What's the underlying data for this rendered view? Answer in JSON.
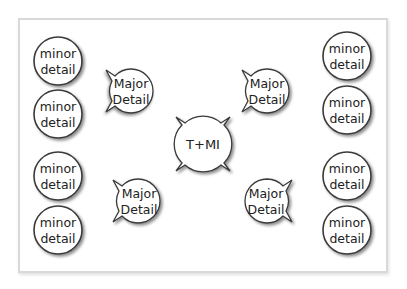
{
  "diagram": {
    "type": "concept-map",
    "center": {
      "label": "T+MI",
      "x": 203,
      "y": 144,
      "r": 27
    },
    "major_details": [
      {
        "id": "major-top-left",
        "line1": "Major",
        "line2": "Detail",
        "x": 131,
        "y": 91,
        "r": 22,
        "tail": "right"
      },
      {
        "id": "major-top-right",
        "line1": "Major",
        "line2": "Detail",
        "x": 267,
        "y": 91,
        "r": 22,
        "tail": "left"
      },
      {
        "id": "major-bottom-left",
        "line1": "Major",
        "line2": "Detail",
        "x": 138,
        "y": 201,
        "r": 22,
        "tail": "right"
      },
      {
        "id": "major-bottom-right",
        "line1": "Major",
        "line2": "Detail",
        "x": 267,
        "y": 201,
        "r": 22,
        "tail": "left"
      }
    ],
    "minor_details": [
      {
        "line1": "minor",
        "line2": "detail",
        "x": 58,
        "y": 61
      },
      {
        "line1": "minor",
        "line2": "detail",
        "x": 58,
        "y": 114
      },
      {
        "line1": "minor",
        "line2": "detail",
        "x": 58,
        "y": 176
      },
      {
        "line1": "minor",
        "line2": "detail",
        "x": 58,
        "y": 230
      },
      {
        "line1": "minor",
        "line2": "detail",
        "x": 347,
        "y": 56
      },
      {
        "line1": "minor",
        "line2": "detail",
        "x": 347,
        "y": 110
      },
      {
        "line1": "minor",
        "line2": "detail",
        "x": 347,
        "y": 176
      },
      {
        "line1": "minor",
        "line2": "detail",
        "x": 347,
        "y": 230
      }
    ],
    "colors": {
      "stroke": "#3a3a3a",
      "fill": "#ffffff",
      "frame_border": "#d9d9d9",
      "text": "#222222"
    }
  }
}
